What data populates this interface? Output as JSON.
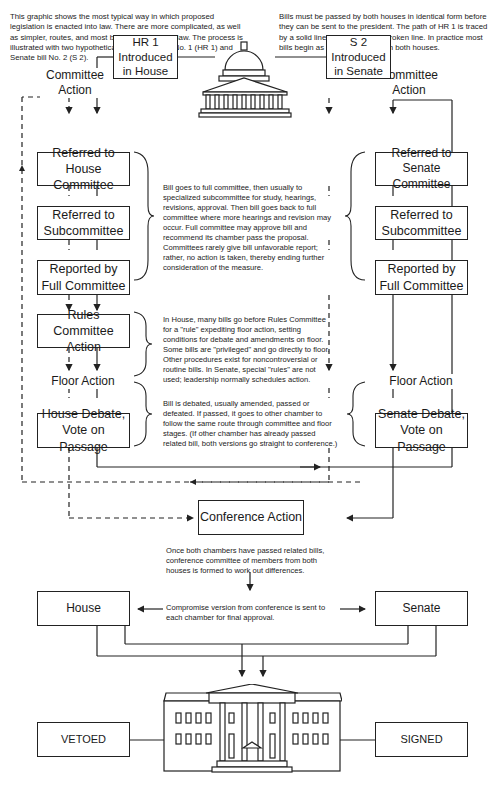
{
  "intro": {
    "left": "This graphic shows the most typical way in which proposed legislation is enacted into law. There are more complicated, as well as simpler, routes, and most bills never become law. The process is illustrated with two hypothetical bills, House bill No. 1 (HR 1) and Senate bill No. 2 (S 2).",
    "right": "Bills must be passed by both houses in identical form before they can be sent to the president. The path of HR 1 is traced by a solid line, that of S 2 by a broken line. In practice most bills begin as similar proposals in both houses."
  },
  "house": {
    "committee_action": "Committee\nAction",
    "introduced": "HR 1\nIntroduced\nin House",
    "referred_committee": "Referred to\nHouse Committee",
    "referred_subcommittee": "Referred to\nSubcommittee",
    "reported": "Reported by\nFull Committee",
    "rules": "Rules Committee\nAction",
    "floor_action": "Floor Action",
    "debate": "House Debate,\nVote on Passage"
  },
  "senate": {
    "committee_action": "Committee\nAction",
    "introduced": "S 2\nIntroduced\nin Senate",
    "referred_committee": "Referred to\nSenate Committee",
    "referred_subcommittee": "Referred to\nSubcommittee",
    "reported": "Reported by\nFull Committee",
    "floor_action": "Floor Action",
    "debate": "Senate Debate,\nVote on Passage"
  },
  "notes": {
    "committee": "Bill goes to full committee, then usually to specialized subcommittee for study, hearings, revisions, approval. Then bill goes back to full committee where more hearings and revision may occur. Full committee may approve bill and recommend its chamber pass the proposal. Committees rarely give bill unfavorable report; rather, no action is taken, thereby ending further consideration of the measure.",
    "rules": "In House, many bills go before Rules Committee for a \"rule\" expediting floor action, setting conditions for debate and amendments on floor. Some bills are \"privileged\" and go directly to floor. Other procedures exist for noncontroversial or routine bills. In Senate, special \"rules\" are not used; leadership normally schedules action.",
    "floor": "Bill is debated, usually amended, passed or defeated. If passed, it goes to other chamber to follow the same route through committee and floor stages. (If other chamber has already passed related bill, both versions go straight to conference.)",
    "conference": "Once both chambers have passed related bills, conference committee of members from both houses is formed to work out differences.",
    "compromise": "Compromise version from conference is sent to each chamber for final approval."
  },
  "conference": {
    "label": "Conference Action"
  },
  "final": {
    "house": "House",
    "senate": "Senate",
    "vetoed": "VETOED",
    "signed": "SIGNED"
  },
  "legend": {
    "solid_line": "HR 1 path",
    "broken_line": "S 2 path"
  }
}
